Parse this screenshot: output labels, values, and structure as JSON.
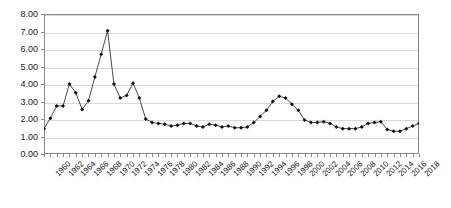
{
  "chart_data": {
    "type": "line",
    "title": "",
    "subtitle": "",
    "xlabel": "",
    "ylabel": "",
    "grid": true,
    "legend": false,
    "marker": "diamond",
    "line_color": "#1a1a1a",
    "marker_color": "#111111",
    "grid_color": "#d9d9d9",
    "axis_color": "#8a8a8a",
    "ylim": [
      0.0,
      8.0
    ],
    "ytick_step": 1.0,
    "ytick_labels": [
      "0.00",
      "1.00",
      "2.00",
      "3.00",
      "4.00",
      "5.00",
      "6.00",
      "7.00",
      "8.00"
    ],
    "ytick_values": [
      0,
      1,
      2,
      3,
      4,
      5,
      6,
      7,
      8
    ],
    "xlim": [
      1960,
      2019
    ],
    "xtick_label_step": 2,
    "xtick_labels": [
      "1960",
      "1962",
      "1964",
      "1966",
      "1968",
      "1970",
      "1972",
      "1974",
      "1976",
      "1978",
      "1980",
      "1982",
      "1984",
      "1986",
      "1988",
      "1990",
      "1992",
      "1994",
      "1996",
      "1998",
      "2000",
      "2002",
      "2004",
      "2006",
      "2008",
      "2010",
      "2012",
      "2014",
      "2016",
      "2018"
    ],
    "x": [
      1960,
      1961,
      1962,
      1963,
      1964,
      1965,
      1966,
      1967,
      1968,
      1969,
      1970,
      1971,
      1972,
      1973,
      1974,
      1975,
      1976,
      1977,
      1978,
      1979,
      1980,
      1981,
      1982,
      1983,
      1984,
      1985,
      1986,
      1987,
      1988,
      1989,
      1990,
      1991,
      1992,
      1993,
      1994,
      1995,
      1996,
      1997,
      1998,
      1999,
      2000,
      2001,
      2002,
      2003,
      2004,
      2005,
      2006,
      2007,
      2008,
      2009,
      2010,
      2011,
      2012,
      2013,
      2014,
      2015,
      2016,
      2017,
      2018,
      2019
    ],
    "values": [
      1.45,
      2.05,
      2.75,
      2.75,
      4.0,
      3.5,
      2.55,
      3.05,
      4.4,
      5.7,
      7.05,
      4.0,
      3.2,
      3.35,
      4.05,
      3.2,
      2.0,
      1.8,
      1.75,
      1.7,
      1.6,
      1.65,
      1.75,
      1.75,
      1.6,
      1.55,
      1.7,
      1.65,
      1.55,
      1.6,
      1.5,
      1.5,
      1.55,
      1.8,
      2.15,
      2.5,
      3.0,
      3.3,
      3.2,
      2.85,
      2.5,
      1.95,
      1.8,
      1.8,
      1.85,
      1.75,
      1.55,
      1.45,
      1.45,
      1.45,
      1.55,
      1.75,
      1.8,
      1.85,
      1.4,
      1.3,
      1.3,
      1.45,
      1.6,
      1.75
    ],
    "series_name": ""
  }
}
